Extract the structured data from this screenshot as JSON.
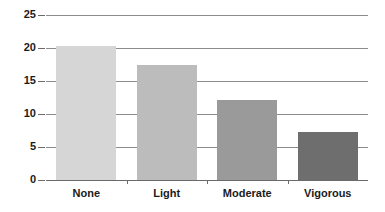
{
  "chart_data": {
    "type": "bar",
    "title": "",
    "subtitle": "",
    "xlabel": "",
    "ylabel": "",
    "categories": [
      "None",
      "Light",
      "Moderate",
      "Vigorous"
    ],
    "values": [
      20.3,
      17.4,
      12.1,
      7.3
    ],
    "series": [
      {
        "name": "",
        "values": [
          20.3,
          17.4,
          12.1,
          7.3
        ]
      }
    ],
    "ylim": [
      0,
      25
    ],
    "yticks": [
      0,
      5,
      10,
      15,
      20,
      25
    ],
    "ytick_labels": [
      "0",
      "5",
      "10",
      "15",
      "20",
      "25"
    ],
    "grid": true,
    "grid_axis": "y",
    "legend": false,
    "legend_position": "none",
    "bar_colors": [
      "#d6d6d6",
      "#bcbcbc",
      "#9a9a9a",
      "#6e6e6e"
    ],
    "annotations": []
  },
  "style": {
    "background": "#ffffff",
    "gridline_color": "#8c8c8c",
    "axis_color": "#6b6b6b",
    "text_color": "#1b1b1b"
  }
}
